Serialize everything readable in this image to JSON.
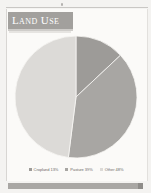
{
  "page": {
    "title": "Land Use"
  },
  "chart_data": {
    "type": "pie",
    "title": "Land Use",
    "categories": [
      "Cropland",
      "Pasture",
      "Other"
    ],
    "values": [
      13,
      39,
      48
    ],
    "unit": "%",
    "start_angle_deg": 0,
    "direction": "clockwise",
    "legend_position": "bottom",
    "colors": [
      "#9d9b98",
      "#a8a6a3",
      "#dcdad7"
    ],
    "slices": [
      {
        "label": "Cropland",
        "value": 13,
        "display": "Cropland 13%",
        "color": "#9d9b98"
      },
      {
        "label": "Pasture",
        "value": 39,
        "display": "Pasture 39%",
        "color": "#a8a6a3"
      },
      {
        "label": "Other",
        "value": 48,
        "display": "Other 48%",
        "color": "#dcdad7"
      }
    ]
  },
  "legend": {
    "items": [
      {
        "label": "Cropland 13%",
        "color": "#9d9b98"
      },
      {
        "label": "Pasture 39%",
        "color": "#a8a6a3"
      },
      {
        "label": "Other 48%",
        "color": "#dcdad7"
      }
    ]
  },
  "colors": {
    "banner": "#a2a09d",
    "footer": "#a9a7a4",
    "page": "#fbfaf8"
  }
}
